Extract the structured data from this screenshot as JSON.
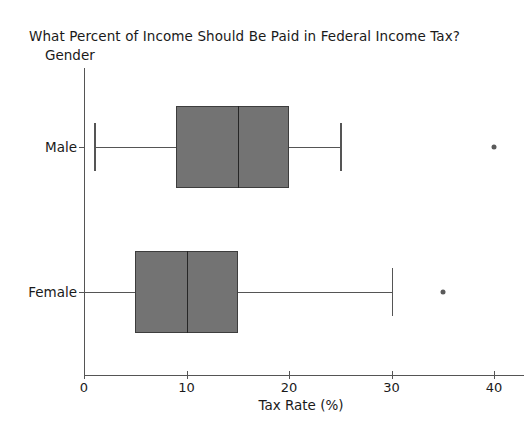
{
  "chart_data": {
    "type": "box",
    "title": "What Percent of Income Should Be Paid in Federal Income Tax?",
    "xlabel": "Tax Rate (%)",
    "ylabel": "Gender",
    "xlim": [
      0,
      41
    ],
    "xticks": [
      0,
      10,
      20,
      30,
      40
    ],
    "xtick_labels": [
      "0",
      "10",
      "20",
      "30",
      "40"
    ],
    "categories": [
      "Male",
      "Female"
    ],
    "orientation": "horizontal",
    "grid": false,
    "legend": "none",
    "box_fill_color": "#737373",
    "box_edge_color": "#3d3d3d",
    "axis_color": "#555555",
    "boxes": [
      {
        "category": "Male",
        "whisker_low": 1,
        "q1": 9,
        "median": 15,
        "q3": 20,
        "whisker_high": 25,
        "outliers": [
          40
        ]
      },
      {
        "category": "Female",
        "whisker_low": 0,
        "q1": 5,
        "median": 10,
        "q3": 15,
        "whisker_high": 30,
        "outliers": [
          35
        ]
      }
    ]
  }
}
